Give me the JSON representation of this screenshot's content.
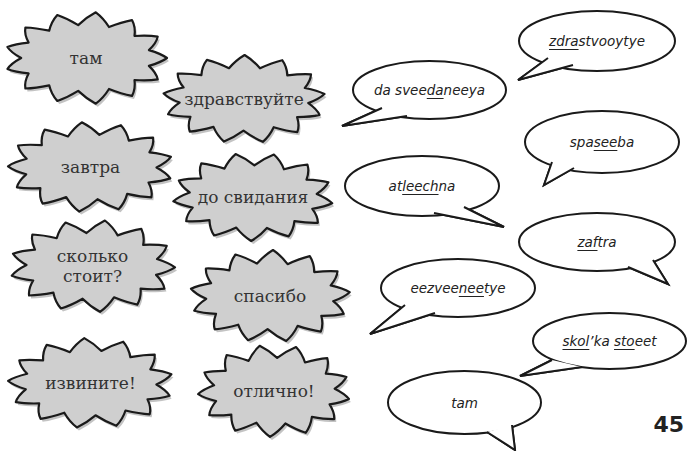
{
  "russian_words": [
    {
      "id": "tam",
      "text": "там"
    },
    {
      "id": "zdravstvuyte",
      "text": "здравствуйте"
    },
    {
      "id": "zavtra",
      "text": "завтра"
    },
    {
      "id": "do-svidaniya",
      "text": "до свидания"
    },
    {
      "id": "skolko-stoit",
      "text": "сколько\nстоит?"
    },
    {
      "id": "spasibo",
      "text": "спасибо"
    },
    {
      "id": "izvinite",
      "text": "извините!"
    },
    {
      "id": "otlichno",
      "text": "отлично!"
    }
  ],
  "pronunciations": [
    {
      "id": "zdrastvooytye",
      "parts": [
        {
          "t": "zdra",
          "u": true
        },
        {
          "t": "stvooytye",
          "u": false
        }
      ]
    },
    {
      "id": "da-sveedaneeya",
      "parts": [
        {
          "t": "da svee",
          "u": false
        },
        {
          "t": "da",
          "u": true
        },
        {
          "t": "neeya",
          "u": false
        }
      ]
    },
    {
      "id": "spaseeba",
      "parts": [
        {
          "t": "spa",
          "u": false
        },
        {
          "t": "see",
          "u": true
        },
        {
          "t": "ba",
          "u": false
        }
      ]
    },
    {
      "id": "atleechna",
      "parts": [
        {
          "t": "at",
          "u": false
        },
        {
          "t": "leech",
          "u": true
        },
        {
          "t": "na",
          "u": false
        }
      ]
    },
    {
      "id": "zaftra",
      "parts": [
        {
          "t": "zaf",
          "u": true
        },
        {
          "t": "tra",
          "u": false
        }
      ]
    },
    {
      "id": "eezveeneetye",
      "parts": [
        {
          "t": "eezvee",
          "u": false
        },
        {
          "t": "nee",
          "u": true
        },
        {
          "t": "tye",
          "u": false
        }
      ]
    },
    {
      "id": "skolka-stoeet",
      "parts": [
        {
          "t": "skol",
          "u": true
        },
        {
          "t": "’ka ",
          "u": false
        },
        {
          "t": "sto",
          "u": true
        },
        {
          "t": "eet",
          "u": false
        }
      ]
    },
    {
      "id": "tam-pron",
      "parts": [
        {
          "t": "tam",
          "u": false
        }
      ]
    }
  ],
  "page_number": "45",
  "colors": {
    "burst_fill": "#cfcfcf",
    "outline": "#1a1a1a",
    "bubble_fill": "#ffffff"
  }
}
